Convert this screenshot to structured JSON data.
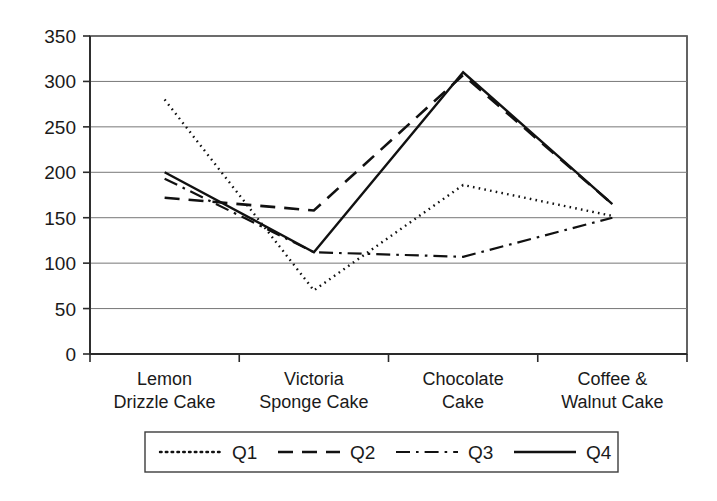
{
  "chart_data": {
    "type": "line",
    "title": "",
    "xlabel": "",
    "ylabel": "",
    "categories": [
      "Lemon Drizzle Cake",
      "Victoria Sponge Cake",
      "Chocolate Cake",
      "Coffee & Walnut Cake"
    ],
    "category_lines": [
      [
        "Lemon",
        "Drizzle Cake"
      ],
      [
        "Victoria",
        "Sponge Cake"
      ],
      [
        "Chocolate",
        "Cake"
      ],
      [
        "Coffee &",
        "Walnut Cake"
      ]
    ],
    "series": [
      {
        "name": "Q1",
        "style": "dotted",
        "values": [
          280,
          70,
          186,
          152
        ]
      },
      {
        "name": "Q2",
        "style": "dashed",
        "values": [
          172,
          158,
          307,
          165
        ]
      },
      {
        "name": "Q3",
        "style": "dashdot",
        "values": [
          193,
          112,
          107,
          150
        ]
      },
      {
        "name": "Q4",
        "style": "solid",
        "values": [
          200,
          112,
          310,
          165
        ]
      }
    ],
    "ylim": [
      0,
      350
    ],
    "ytick_values": [
      0,
      50,
      100,
      150,
      200,
      250,
      300,
      350
    ],
    "ytick_labels": [
      "0",
      "50",
      "100",
      "150",
      "200",
      "250",
      "300",
      "350"
    ],
    "grid": true,
    "grid_axis": "y",
    "legend_position": "bottom",
    "legend_entries": [
      "Q1",
      "Q2",
      "Q3",
      "Q4"
    ],
    "line_color": "#111111"
  },
  "axis": {
    "y_labels": [
      "350",
      "300",
      "250",
      "200",
      "150",
      "100",
      "50",
      "0"
    ]
  },
  "legend": {
    "items": [
      {
        "label": "Q1"
      },
      {
        "label": "Q2"
      },
      {
        "label": "Q3"
      },
      {
        "label": "Q4"
      }
    ]
  },
  "categories_display": [
    {
      "line1": "Lemon",
      "line2": "Drizzle Cake"
    },
    {
      "line1": "Victoria",
      "line2": "Sponge Cake"
    },
    {
      "line1": "Chocolate",
      "line2": "Cake"
    },
    {
      "line1": "Coffee &",
      "line2": "Walnut Cake"
    }
  ]
}
